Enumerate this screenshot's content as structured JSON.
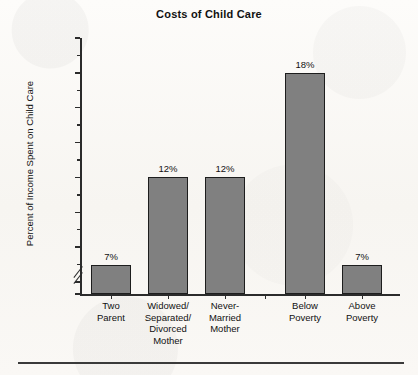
{
  "chart_data": {
    "type": "bar",
    "title": "Costs of Child Care",
    "xlabel": "",
    "ylabel": "Percent of Income Spent on Child Care",
    "categories": [
      "Two Parent",
      "Widowed/ Separated/ Divorced Mother",
      "Never- Married Mother",
      "Below Poverty",
      "Above Poverty"
    ],
    "category_lines": [
      [
        "Two",
        "Parent"
      ],
      [
        "Widowed/",
        "Separated/",
        "Divorced",
        "Mother"
      ],
      [
        "Never-",
        "Married",
        "Mother"
      ],
      [
        "Below",
        "Poverty"
      ],
      [
        "Above",
        "Poverty"
      ]
    ],
    "values": [
      7,
      12,
      12,
      18,
      7
    ],
    "data_labels": [
      "7%",
      "12%",
      "12%",
      "18%",
      "7%"
    ],
    "ylim": [
      0,
      20
    ],
    "axis_break": {
      "present": true,
      "between": [
        0,
        6
      ]
    },
    "ytick_labels": [
      "0%",
      "6%",
      "8%",
      "10%",
      "12%",
      "14%",
      "16%",
      "18%",
      "20%"
    ],
    "ytick_values": [
      0,
      6,
      8,
      10,
      12,
      14,
      16,
      18,
      20
    ],
    "yminor_values": [
      7,
      9,
      11,
      13,
      15,
      17,
      19
    ],
    "grid": false,
    "legend": false,
    "group_gap_after_index": 2,
    "bar_color": "#808080",
    "bar_border_color": "#1d1d1d",
    "axis_color": "#2b2b2b",
    "background_color": "#fbfaf7"
  }
}
